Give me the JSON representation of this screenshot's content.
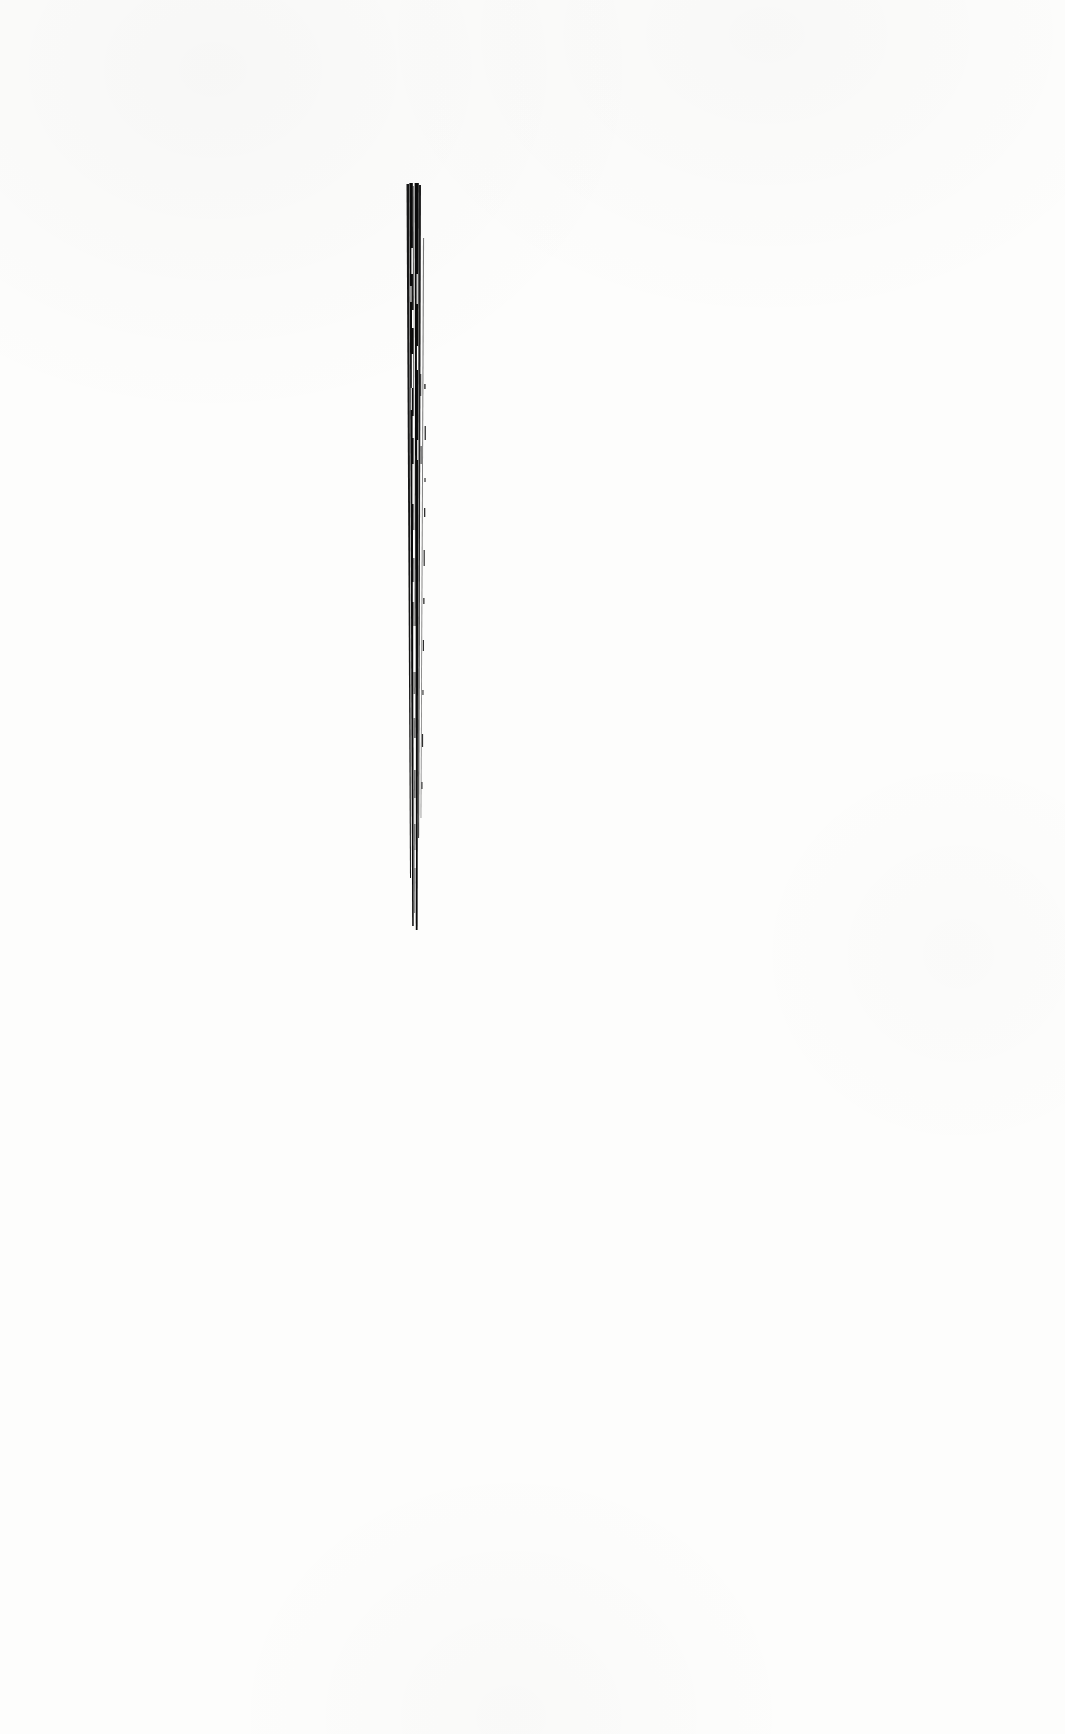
{
  "document": {
    "kind": "scanned-plate-page",
    "page_background_color": "#fdfdfc",
    "ink_color": "#0b0b0b",
    "page_width": 1065,
    "page_height": 1734,
    "visible_text": "",
    "caption": "",
    "page_number": "",
    "has_text": false,
    "notes": "Page is blank apart from a single monochrome figure in the upper-middle area."
  },
  "figure": {
    "name": "vertical-stroke-bundle",
    "description": "Narrow vertical bundle of dense black engraved strokes resembling a needle, bristle or slender plant organ",
    "style": "woodcut / line engraving, pure black on white, no halftone",
    "ink_color": "#0b0b0b",
    "bounds": {
      "left": 438,
      "top": 183,
      "right": 478,
      "bottom": 930,
      "width": 40,
      "height": 747
    },
    "top_terminus": "blunt",
    "bottom_terminus": "tapered-point",
    "orientation": "vertical",
    "tilt_degrees": 0.6,
    "strand_count": 6,
    "strands": [
      {
        "id": "strand-1",
        "role": "left-edge",
        "top_x": 2.5,
        "bot_x": 6.0,
        "top_y": 6,
        "bot_y": 700,
        "top_w": 2.6,
        "bot_w": 1.0,
        "opacity": 0.95
      },
      {
        "id": "strand-2",
        "role": "left-core",
        "top_x": 5.4,
        "bot_x": 8.2,
        "top_y": 5,
        "bot_y": 748,
        "top_w": 3.4,
        "bot_w": 1.5,
        "opacity": 1.0
      },
      {
        "id": "strand-3",
        "role": "centre-hairline",
        "top_x": 8.6,
        "bot_x": 10.4,
        "top_y": 8,
        "bot_y": 735,
        "top_w": 1.1,
        "bot_w": 0.7,
        "opacity": 0.72
      },
      {
        "id": "strand-4",
        "role": "right-core",
        "top_x": 10.6,
        "bot_x": 11.8,
        "top_y": 5,
        "bot_y": 752,
        "top_w": 4.2,
        "bot_w": 1.8,
        "opacity": 1.0
      },
      {
        "id": "strand-5",
        "role": "right-edge",
        "top_x": 15.0,
        "bot_x": 14.2,
        "top_y": 7,
        "bot_y": 660,
        "top_w": 2.0,
        "bot_w": 0.9,
        "opacity": 0.92
      },
      {
        "id": "strand-6",
        "role": "outer-dash",
        "top_x": 19.0,
        "bot_x": 16.6,
        "top_y": 60,
        "bot_y": 640,
        "top_w": 1.1,
        "bot_w": 0.7,
        "opacity": 0.55
      }
    ],
    "highlight_gaps": [
      {
        "x": 7.4,
        "y": 70,
        "h": 26,
        "w": 1.5
      },
      {
        "x": 8.0,
        "y": 132,
        "h": 18,
        "w": 1.8
      },
      {
        "x": 7.8,
        "y": 176,
        "h": 34,
        "w": 1.4
      },
      {
        "x": 8.6,
        "y": 238,
        "h": 22,
        "w": 1.6
      },
      {
        "x": 8.4,
        "y": 286,
        "h": 40,
        "w": 1.5
      },
      {
        "x": 9.0,
        "y": 352,
        "h": 28,
        "w": 1.9
      },
      {
        "x": 8.8,
        "y": 404,
        "h": 20,
        "w": 1.4
      },
      {
        "x": 9.4,
        "y": 448,
        "h": 46,
        "w": 2.1
      },
      {
        "x": 9.6,
        "y": 516,
        "h": 24,
        "w": 1.5
      },
      {
        "x": 10.0,
        "y": 560,
        "h": 32,
        "w": 1.8
      },
      {
        "x": 10.2,
        "y": 620,
        "h": 26,
        "w": 1.4
      },
      {
        "x": 10.6,
        "y": 672,
        "h": 18,
        "w": 1.3
      },
      {
        "x": 6.4,
        "y": 108,
        "h": 16,
        "w": 1.1
      },
      {
        "x": 6.8,
        "y": 210,
        "h": 22,
        "w": 1.0
      },
      {
        "x": 12.6,
        "y": 96,
        "h": 30,
        "w": 1.2
      },
      {
        "x": 12.9,
        "y": 168,
        "h": 24,
        "w": 1.1
      },
      {
        "x": 13.2,
        "y": 262,
        "h": 20,
        "w": 1.0
      }
    ],
    "detached_marks": [
      {
        "x": 20.2,
        "y": 206,
        "w": 1.4,
        "h": 5
      },
      {
        "x": 20.6,
        "y": 248,
        "w": 1.3,
        "h": 14
      },
      {
        "x": 20.4,
        "y": 300,
        "w": 1.2,
        "h": 4
      },
      {
        "x": 20.0,
        "y": 330,
        "w": 1.3,
        "h": 9
      },
      {
        "x": 19.6,
        "y": 372,
        "w": 1.2,
        "h": 16
      },
      {
        "x": 19.2,
        "y": 420,
        "w": 1.3,
        "h": 6
      },
      {
        "x": 18.8,
        "y": 462,
        "w": 1.2,
        "h": 11
      },
      {
        "x": 18.4,
        "y": 512,
        "w": 1.1,
        "h": 5
      },
      {
        "x": 17.9,
        "y": 556,
        "w": 1.2,
        "h": 13
      },
      {
        "x": 17.4,
        "y": 604,
        "w": 1.1,
        "h": 7
      },
      {
        "x": 16.2,
        "y": 196,
        "w": 1.0,
        "h": 22
      },
      {
        "x": 16.6,
        "y": 268,
        "w": 1.0,
        "h": 18
      }
    ]
  }
}
